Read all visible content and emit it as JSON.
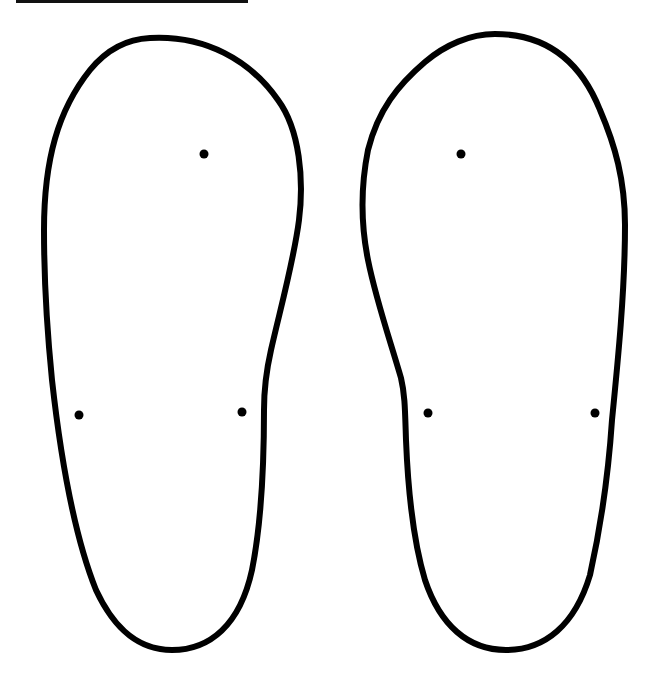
{
  "page": {
    "background_color": "#ffffff",
    "line_color": "#000000"
  },
  "soles": [
    {
      "id": "left-sole",
      "dots": [
        {
          "x": 204,
          "y": 154
        },
        {
          "x": 79,
          "y": 415
        },
        {
          "x": 242,
          "y": 412
        }
      ]
    },
    {
      "id": "right-sole",
      "dots": [
        {
          "x": 461,
          "y": 154
        },
        {
          "x": 428,
          "y": 413
        },
        {
          "x": 595,
          "y": 413
        }
      ]
    }
  ]
}
